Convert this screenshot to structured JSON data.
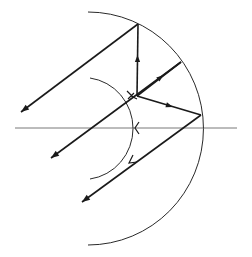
{
  "diagram": {
    "type": "optics-ray-diagram",
    "colors": {
      "ray": "#1a1a1a",
      "arc": "#2a2a2a",
      "axis": "#555555",
      "background": "#ffffff"
    },
    "optical_axis": {
      "x1": 15,
      "y1": 128,
      "x2": 237,
      "y2": 128
    },
    "outer_arc": {
      "d": "M 88 12 A 115 116 0 0 1 88 245"
    },
    "inner_arc": {
      "d": "M 90 78 A 50 51 0 0 1 90 179"
    },
    "rays": [
      {
        "id": "ray-top-left",
        "x1": 138,
        "y1": 24,
        "x2": 21,
        "y2": 112
      },
      {
        "id": "ray-vertical",
        "x1": 137,
        "y1": 96,
        "x2": 138,
        "y2": 24
      },
      {
        "id": "ray-to-upper-right",
        "x1": 137,
        "y1": 96,
        "x2": 181,
        "y2": 62
      },
      {
        "id": "ray-to-right",
        "x1": 137,
        "y1": 96,
        "x2": 201,
        "y2": 115
      },
      {
        "id": "ray-upper-right-down-left",
        "x1": 181,
        "y1": 62,
        "x2": 51,
        "y2": 158
      },
      {
        "id": "ray-right-down-left",
        "x1": 201,
        "y1": 115,
        "x2": 82,
        "y2": 202
      }
    ],
    "end_arrows": [
      {
        "x": 21,
        "y": 112,
        "angle": 143
      },
      {
        "x": 51,
        "y": 158,
        "angle": 144
      },
      {
        "x": 82,
        "y": 202,
        "angle": 144
      }
    ],
    "mid_arrows": [
      {
        "x": 137.5,
        "y": 58,
        "angle": -90
      },
      {
        "x": 161,
        "y": 77,
        "angle": -38
      },
      {
        "x": 170,
        "y": 106,
        "angle": 17
      }
    ],
    "tick_marks": [
      {
        "x": 131,
        "y": 95,
        "label": "inner-arc-crossing-upper"
      },
      {
        "x": 141,
        "y": 128,
        "label": "inner-arc-axis-crossing"
      },
      {
        "x": 132,
        "y": 160,
        "label": "inner-arc-crossing-lower"
      }
    ]
  }
}
